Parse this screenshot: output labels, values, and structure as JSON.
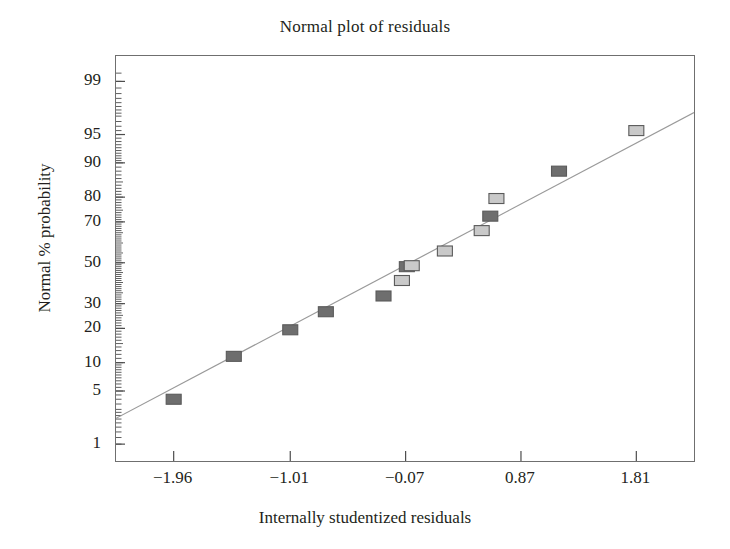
{
  "chart_data": {
    "type": "scatter",
    "title": "Normal plot of residuals",
    "xlabel": "Internally studentized residuals",
    "ylabel": "Normal % probability",
    "grid": false,
    "legend": null,
    "xlim": [
      -2.43,
      2.28
    ],
    "ylim_percent": [
      0.55,
      99.6
    ],
    "x_ticks": [
      "−1.96",
      "−1.01",
      "−0.07",
      "0.87",
      "1.81"
    ],
    "x_tick_values": [
      -1.96,
      -1.01,
      -0.07,
      0.87,
      1.81
    ],
    "y_ticks": [
      "99",
      "95",
      "90",
      "80",
      "70",
      "50",
      "30",
      "20",
      "10",
      "5",
      "1"
    ],
    "y_tick_values": [
      99,
      95,
      90,
      80,
      70,
      50,
      30,
      20,
      10,
      5,
      1
    ],
    "y_scale": "normal-probability",
    "minor_ticks": true,
    "points": [
      {
        "x": -1.96,
        "p": 4.0,
        "fill": "#6e6e6e"
      },
      {
        "x": -1.47,
        "p": 11.5,
        "fill": "#6e6e6e"
      },
      {
        "x": -1.01,
        "p": 19.5,
        "fill": "#6e6e6e"
      },
      {
        "x": -0.72,
        "p": 26.5,
        "fill": "#6e6e6e"
      },
      {
        "x": -0.25,
        "p": 33.5,
        "fill": "#6e6e6e"
      },
      {
        "x": -0.1,
        "p": 41.0,
        "fill": "#c9c9c9"
      },
      {
        "x": -0.06,
        "p": 48.0,
        "fill": "#6e6e6e"
      },
      {
        "x": -0.02,
        "p": 48.5,
        "fill": "#c9c9c9"
      },
      {
        "x": 0.25,
        "p": 56.0,
        "fill": "#c9c9c9"
      },
      {
        "x": 0.55,
        "p": 66.0,
        "fill": "#c9c9c9"
      },
      {
        "x": 0.62,
        "p": 72.5,
        "fill": "#6e6e6e"
      },
      {
        "x": 0.67,
        "p": 79.5,
        "fill": "#c9c9c9"
      },
      {
        "x": 1.18,
        "p": 88.0,
        "fill": "#6e6e6e"
      },
      {
        "x": 1.81,
        "p": 95.5,
        "fill": "#c9c9c9"
      }
    ],
    "reference_line": {
      "x_start": -2.43,
      "p_start": 2.3,
      "x_end": 2.28,
      "p_end": 97.3,
      "color": "#9a9a9a"
    }
  },
  "style": {
    "frame_color": "#6f6f6f",
    "tick_color": "#4d4d4d",
    "text_color": "#231f20",
    "marker_edge": "#5a5a5a",
    "background": "#ffffff"
  }
}
